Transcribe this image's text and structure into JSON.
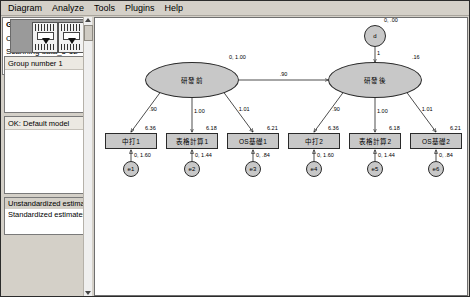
{
  "window": {
    "menu": [
      {
        "label": "Diagram"
      },
      {
        "label": "Analyze"
      },
      {
        "label": "Tools"
      },
      {
        "label": "Plugins"
      },
      {
        "label": "Help"
      }
    ]
  },
  "sidebar": {
    "palette": {
      "name": "model-thumbnail-palette"
    },
    "group_panel": {
      "header": "Group number 1"
    },
    "model_panel": {
      "header": "OK: Default model"
    },
    "estimates_panel": {
      "options": [
        {
          "label": "Unstandardized estimates",
          "selected": true
        },
        {
          "label": "Standardized estimates",
          "selected": false
        }
      ]
    },
    "log_panel": {
      "lines": [
        "GROUP NUMBER 1",
        "Check for incomplete",
        "Scanning data_5-12",
        "Reading data"
      ]
    }
  },
  "chart_data": {
    "type": "diagram",
    "title": "",
    "subtype": "sem-path-diagram",
    "estimates_mode": "Unstandardized estimates",
    "latents": [
      {
        "id": "F1",
        "label": "研發前",
        "param": "0, 1.00",
        "cx": 97,
        "cy": 62,
        "rx": 47,
        "ry": 18
      },
      {
        "id": "F2",
        "label": "研發後",
        "param": ".16",
        "cx": 280,
        "cy": 62,
        "rx": 47,
        "ry": 18
      }
    ],
    "disturbance": {
      "id": "d",
      "label": "d",
      "param": "0, .00",
      "arrow_label": "1",
      "cx": 280,
      "cy": 18,
      "r": 11
    },
    "structural_path": {
      "from": "F1",
      "to": "F2",
      "label": ".90"
    },
    "indicators": [
      {
        "id": "中打1",
        "label": "中打1",
        "intercept": "6.36",
        "loading": ".90",
        "error": {
          "id": "e1",
          "param": "0, 1.60"
        },
        "cx": 36,
        "cy": 123
      },
      {
        "id": "表格計算1",
        "label": "表格計算1",
        "intercept": "6.18",
        "loading": "1.00",
        "error": {
          "id": "e2",
          "param": "0, 1.44"
        },
        "cx": 97,
        "cy": 123
      },
      {
        "id": "OS基礎1",
        "label": "OS基礎1",
        "intercept": "6.21",
        "loading": "1.01",
        "error": {
          "id": "e3",
          "param": "0, .84"
        },
        "cx": 158,
        "cy": 123
      },
      {
        "id": "中打2",
        "label": "中打2",
        "intercept": "6.36",
        "loading": ".90",
        "error": {
          "id": "e4",
          "param": "0, 1.60"
        },
        "cx": 219,
        "cy": 123
      },
      {
        "id": "表格計算2",
        "label": "表格計算2",
        "intercept": "6.18",
        "loading": "1.00",
        "error": {
          "id": "e5",
          "param": "0, 1.44"
        },
        "cx": 280,
        "cy": 123
      },
      {
        "id": "OS基礎2",
        "label": "OS基礎2",
        "intercept": "6.21",
        "loading": "1.01",
        "error": {
          "id": "e6",
          "param": "0, .84"
        },
        "cx": 341,
        "cy": 123
      }
    ],
    "colors": {
      "node_fill": "#c8c8c8",
      "node_stroke": "#2a2a2a",
      "canvas": "#ffffff",
      "chrome": "#d4d0c8"
    }
  }
}
